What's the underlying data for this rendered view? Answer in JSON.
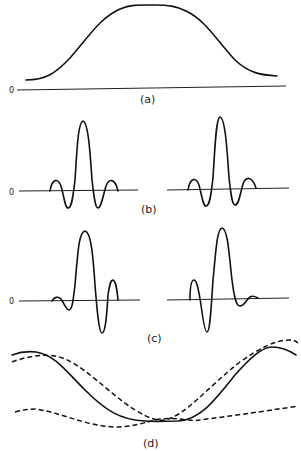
{
  "figure": {
    "panels": [
      {
        "id": "a",
        "label": "(a)",
        "zero_label": "0",
        "description": "Broad bell-shaped (flat-topped) envelope above baseline"
      },
      {
        "id": "b",
        "label": "(b)",
        "zero_label": "0",
        "description": "Two symmetric sinc-like wavelets with central peak and side lobes"
      },
      {
        "id": "c",
        "label": "(c)",
        "zero_label": "0",
        "description": "Two asymmetric wavelets, mirror images of each other"
      },
      {
        "id": "d",
        "label": "(d)",
        "description": "Solid cosine-like curve with two dashed comparison curves"
      }
    ]
  }
}
